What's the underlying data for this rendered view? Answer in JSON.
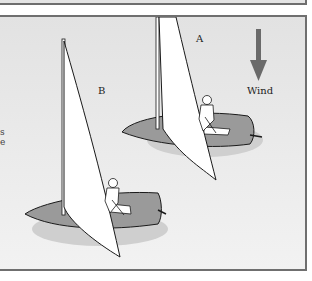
{
  "labels": {
    "boat_a": "A",
    "boat_b": "B",
    "wind": "Wind"
  },
  "left_edge_fragment": {
    "line1": "s",
    "line2": "e"
  },
  "colors": {
    "panel_border": "#6f6f6f",
    "hull": "#9a9a9a",
    "sail": "#ffffff",
    "arrow": "#6a6a6a",
    "outline": "#1a1a1a"
  }
}
